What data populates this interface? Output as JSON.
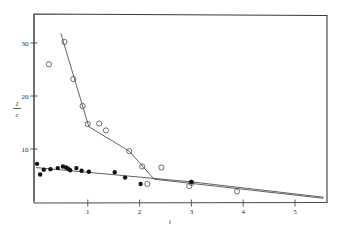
{
  "figure": {
    "background": "#ffffff",
    "ink_color": "#2b2b2b",
    "line_color": "#3a3a3a"
  },
  "chart_data": {
    "type": "scatter",
    "title": "",
    "subtitle": "",
    "xlabel": "t",
    "ylabel": "1/c",
    "ylabel_numerator": "1",
    "ylabel_denominator": "c",
    "grid": false,
    "legend": "none",
    "xlim": [
      0,
      5.6
    ],
    "ylim": [
      0,
      35.5
    ],
    "xticks": [
      1,
      2,
      3,
      4,
      5
    ],
    "xtick_labels": [
      "1",
      "2",
      "3",
      "4",
      "5"
    ],
    "yticks": [
      10,
      20,
      30
    ],
    "ytick_labels": [
      "10",
      "20",
      "30"
    ],
    "series": [
      {
        "name": "open-circles",
        "marker": "open-circle",
        "marker_color": "#4a4a4a",
        "points": [
          {
            "x": 0.25,
            "y": 26.0
          },
          {
            "x": 0.55,
            "y": 30.2
          },
          {
            "x": 0.72,
            "y": 23.2
          },
          {
            "x": 0.9,
            "y": 18.1
          },
          {
            "x": 1.0,
            "y": 14.7
          },
          {
            "x": 1.22,
            "y": 14.8
          },
          {
            "x": 1.35,
            "y": 13.5
          },
          {
            "x": 1.8,
            "y": 9.6
          },
          {
            "x": 2.05,
            "y": 6.7
          },
          {
            "x": 2.15,
            "y": 3.4
          },
          {
            "x": 2.42,
            "y": 6.5
          },
          {
            "x": 2.96,
            "y": 3.0
          },
          {
            "x": 3.0,
            "y": 3.6
          },
          {
            "x": 3.88,
            "y": 2.0
          }
        ],
        "fit_line": [
          {
            "x": 0.48,
            "y": 31.8
          },
          {
            "x": 1.02,
            "y": 14.2
          },
          {
            "x": 1.8,
            "y": 9.6
          },
          {
            "x": 2.28,
            "y": 4.3
          },
          {
            "x": 5.55,
            "y": 0.7
          }
        ]
      },
      {
        "name": "filled-circles",
        "marker": "filled-circle",
        "marker_color": "#111111",
        "points": [
          {
            "x": 0.02,
            "y": 7.2
          },
          {
            "x": 0.08,
            "y": 5.2
          },
          {
            "x": 0.15,
            "y": 6.1
          },
          {
            "x": 0.28,
            "y": 6.2
          },
          {
            "x": 0.42,
            "y": 6.4
          },
          {
            "x": 0.52,
            "y": 6.7
          },
          {
            "x": 0.58,
            "y": 6.5
          },
          {
            "x": 0.62,
            "y": 6.3
          },
          {
            "x": 0.66,
            "y": 6.0
          },
          {
            "x": 0.78,
            "y": 6.4
          },
          {
            "x": 0.88,
            "y": 5.9
          },
          {
            "x": 1.02,
            "y": 5.7
          },
          {
            "x": 1.52,
            "y": 5.6
          },
          {
            "x": 1.72,
            "y": 4.6
          },
          {
            "x": 2.02,
            "y": 3.4
          },
          {
            "x": 3.0,
            "y": 3.8
          }
        ],
        "fit_line": [
          {
            "x": 0.0,
            "y": 6.5
          },
          {
            "x": 3.0,
            "y": 3.8
          },
          {
            "x": 5.55,
            "y": 0.9
          }
        ]
      }
    ]
  }
}
